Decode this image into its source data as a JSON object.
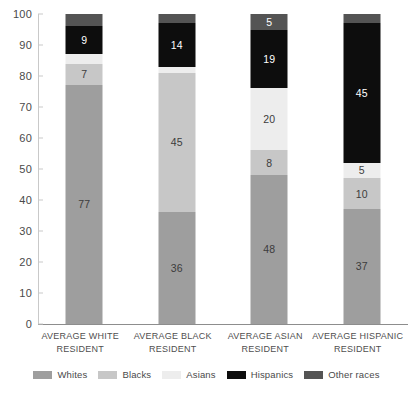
{
  "chart_data": {
    "type": "bar",
    "variant": "stacked-bar-100",
    "title": "",
    "subtitle": "",
    "xlabel": "",
    "ylabel": "",
    "ylim": [
      0,
      100
    ],
    "yticks": [
      0,
      10,
      20,
      30,
      40,
      50,
      60,
      70,
      80,
      90,
      100
    ],
    "ytick_labels": [
      "0",
      "10",
      "20",
      "30",
      "40",
      "50",
      "60",
      "70",
      "80",
      "90",
      "100"
    ],
    "grid": false,
    "legend_position": "bottom",
    "categories": [
      "AVERAGE WHITE RESIDENT",
      "AVERAGE BLACK RESIDENT",
      "AVERAGE ASIAN RESIDENT",
      "AVERAGE HISPANIC RESIDENT"
    ],
    "category_lines": [
      [
        "AVERAGE WHITE",
        "RESIDENT"
      ],
      [
        "AVERAGE BLACK",
        "RESIDENT"
      ],
      [
        "AVERAGE ASIAN",
        "RESIDENT"
      ],
      [
        "AVERAGE HISPANIC",
        "RESIDENT"
      ]
    ],
    "series": [
      {
        "name": "Whites",
        "color": "#9e9e9e",
        "label_color": "#3c3c3c",
        "values": [
          77,
          36,
          48,
          37
        ],
        "labels": [
          "77",
          "36",
          "48",
          "37"
        ]
      },
      {
        "name": "Blacks",
        "color": "#c7c7c7",
        "label_color": "#3c3c3c",
        "values": [
          7,
          45,
          8,
          10
        ],
        "labels": [
          "7",
          "45",
          "8",
          "10"
        ]
      },
      {
        "name": "Asians",
        "color": "#ededed",
        "label_color": "#3c3c3c",
        "values": [
          3,
          2,
          20,
          5
        ],
        "labels": [
          "",
          "",
          "20",
          "5"
        ]
      },
      {
        "name": "Hispanics",
        "color": "#0d0d0d",
        "label_color": "#ffffff",
        "values": [
          9,
          14,
          19,
          45
        ],
        "labels": [
          "9",
          "14",
          "19",
          "45"
        ]
      },
      {
        "name": "Other races",
        "color": "#545454",
        "label_color": "#ffffff",
        "values": [
          4,
          3,
          5,
          3
        ],
        "labels": [
          "",
          "",
          "5",
          ""
        ]
      }
    ]
  },
  "legend": {
    "items": [
      {
        "label": "Whites",
        "color": "#9e9e9e"
      },
      {
        "label": "Blacks",
        "color": "#c7c7c7"
      },
      {
        "label": "Asians",
        "color": "#ededed"
      },
      {
        "label": "Hispanics",
        "color": "#0d0d0d"
      },
      {
        "label": "Other races",
        "color": "#545454"
      }
    ]
  },
  "footer": {
    "source_note": ""
  }
}
